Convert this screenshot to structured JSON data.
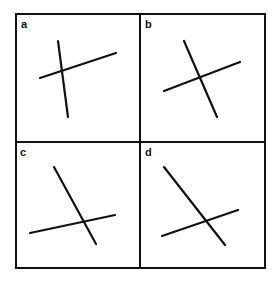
{
  "figure": {
    "colors": {
      "line": "#111111",
      "background": "#ffffff"
    },
    "frame": {
      "x": 16,
      "y": 14,
      "width": 249,
      "height": 254,
      "divider_x": 140,
      "divider_y": 142
    },
    "panels": [
      {
        "label": "a",
        "label_pos": [
          21,
          28
        ],
        "lines": [
          [
            40,
            78,
            116,
            53
          ],
          [
            58,
            41,
            68,
            117
          ]
        ]
      },
      {
        "label": "b",
        "label_pos": [
          145,
          28
        ],
        "lines": [
          [
            164,
            91,
            240,
            62
          ],
          [
            184,
            41,
            217,
            117
          ]
        ]
      },
      {
        "label": "c",
        "label_pos": [
          20,
          156
        ],
        "lines": [
          [
            30,
            233,
            115,
            215
          ],
          [
            54,
            167,
            96,
            244
          ]
        ]
      },
      {
        "label": "d",
        "label_pos": [
          145,
          156
        ],
        "lines": [
          [
            162,
            236,
            238,
            210
          ],
          [
            164,
            167,
            225,
            245
          ]
        ]
      }
    ]
  }
}
